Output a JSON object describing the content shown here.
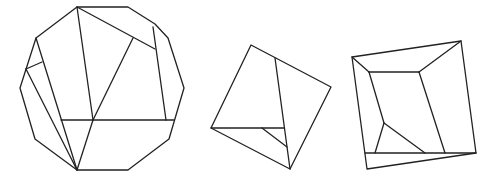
{
  "figure": {
    "width": 496,
    "height": 187,
    "stroke_color": "#222222",
    "background": "#ffffff",
    "shapes": [
      {
        "name": "dodecagon-dissection",
        "outline": [
          [
            77,
            7
          ],
          [
            128,
            7
          ],
          [
            155,
            24
          ],
          [
            168,
            38
          ],
          [
            184,
            88
          ],
          [
            174,
            122
          ],
          [
            169,
            139
          ],
          [
            128,
            170
          ],
          [
            77,
            170
          ],
          [
            35,
            139
          ],
          [
            20,
            88
          ],
          [
            36,
            38
          ]
        ],
        "segments": [
          [
            [
              77,
              7
            ],
            [
              155,
              49
            ]
          ],
          [
            [
              77,
              7
            ],
            [
              93,
              120
            ]
          ],
          [
            [
              133,
              38
            ],
            [
              93,
              120
            ]
          ],
          [
            [
              153,
              27
            ],
            [
              166,
              120
            ]
          ],
          [
            [
              61,
              120
            ],
            [
              174,
              120
            ]
          ],
          [
            [
              36,
              38
            ],
            [
              77,
              170
            ]
          ],
          [
            [
              26,
              69
            ],
            [
              77,
              170
            ]
          ],
          [
            [
              26,
              69
            ],
            [
              42,
              62
            ]
          ],
          [
            [
              93,
              120
            ],
            [
              77,
              170
            ]
          ]
        ]
      },
      {
        "name": "square-dissection",
        "outline": [
          [
            251,
            45
          ],
          [
            331,
            87
          ],
          [
            290,
            169
          ],
          [
            211,
            128
          ]
        ],
        "segments": [
          [
            [
              275,
              58
            ],
            [
              290,
              169
            ]
          ],
          [
            [
              211,
              128
            ],
            [
              284,
              128
            ]
          ],
          [
            [
              262,
              128
            ],
            [
              287,
              147
            ]
          ]
        ]
      },
      {
        "name": "quadrilateral-dissection",
        "outline": [
          [
            352,
            57
          ],
          [
            461,
            41
          ],
          [
            476,
            153
          ],
          [
            367,
            169
          ]
        ],
        "segments": [
          [
            [
              352,
              57
            ],
            [
              369,
              72
            ]
          ],
          [
            [
              369,
              72
            ],
            [
              419,
              72
            ]
          ],
          [
            [
              419,
              72
            ],
            [
              461,
              41
            ]
          ],
          [
            [
              369,
              72
            ],
            [
              384,
              123
            ]
          ],
          [
            [
              384,
              123
            ],
            [
              375,
              153
            ]
          ],
          [
            [
              384,
              123
            ],
            [
              425,
              153
            ]
          ],
          [
            [
              419,
              72
            ],
            [
              445,
              153
            ]
          ],
          [
            [
              365,
              153
            ],
            [
              476,
              153
            ]
          ]
        ]
      }
    ]
  }
}
